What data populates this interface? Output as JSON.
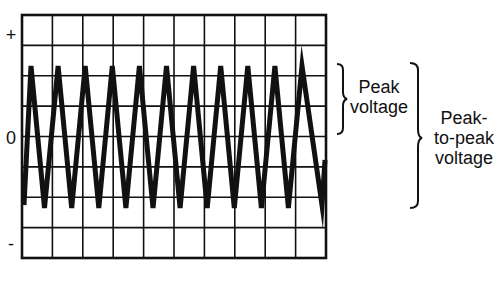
{
  "axis": {
    "plus_label": "+",
    "zero_label": "0",
    "minus_label": "-"
  },
  "grid": {
    "columns": 10,
    "rows": 8
  },
  "waveform": {
    "type": "triangle",
    "peak_count": 11,
    "trough_count": 10
  },
  "annotations": {
    "peak_voltage": [
      "Peak",
      "voltage"
    ],
    "peak_to_peak_voltage": [
      "Peak-",
      "to-peak",
      "voltage"
    ]
  },
  "colors": {
    "line": "#111111",
    "background": "#ffffff"
  }
}
